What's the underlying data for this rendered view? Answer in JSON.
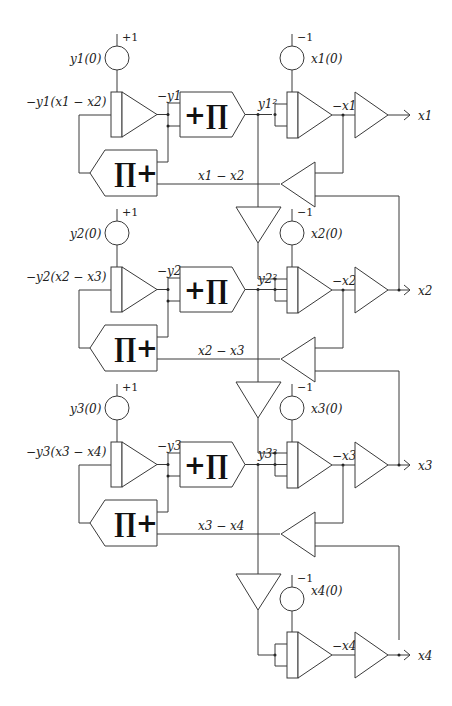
{
  "stages": [
    {
      "integrator_y": {
        "ic_label": "y1(0)",
        "ic_sign": "+1",
        "input_label": "−y1(x1 − x2)",
        "output_label": "−y1"
      },
      "multiplier_square": {
        "symbol": "+∏",
        "output_label": "y1²"
      },
      "multiplier_feedback": {
        "symbol": "∏+",
        "diff_label": "x1 − x2"
      },
      "integrator_x": {
        "ic_label": "x1(0)",
        "ic_sign": "−1",
        "output_label": "−x1"
      },
      "inverter_output": "x1"
    },
    {
      "integrator_y": {
        "ic_label": "y2(0)",
        "ic_sign": "+1",
        "input_label": "−y2(x2 − x3)",
        "output_label": "−y2"
      },
      "multiplier_square": {
        "symbol": "+∏",
        "output_label": "y2²"
      },
      "multiplier_feedback": {
        "symbol": "∏+",
        "diff_label": "x2 − x3"
      },
      "integrator_x": {
        "ic_label": "x2(0)",
        "ic_sign": "−1",
        "output_label": "−x2"
      },
      "inverter_output": "x2"
    },
    {
      "integrator_y": {
        "ic_label": "y3(0)",
        "ic_sign": "+1",
        "input_label": "−y3(x3 − x4)",
        "output_label": "−y3"
      },
      "multiplier_square": {
        "symbol": "+∏",
        "output_label": "y3²"
      },
      "multiplier_feedback": {
        "symbol": "∏+",
        "diff_label": "x3 − x4"
      },
      "integrator_x": {
        "ic_label": "x3(0)",
        "ic_sign": "−1",
        "output_label": "−x3"
      },
      "inverter_output": "x3"
    }
  ],
  "final_stage": {
    "integrator_x": {
      "ic_label": "x4(0)",
      "ic_sign": "−1",
      "output_label": "−x4"
    },
    "inverter_output": "x4"
  }
}
